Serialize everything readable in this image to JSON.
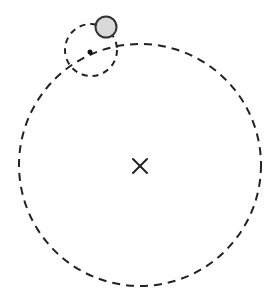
{
  "diagram": {
    "type": "epicycle-orbit",
    "deferent": {
      "cx": 140,
      "cy": 165,
      "r": 121,
      "stroke": "#222222",
      "dash": "8 6"
    },
    "epicycle": {
      "cx": 91,
      "cy": 50,
      "r": 26,
      "stroke": "#222222",
      "dash": "6 5"
    },
    "epicycle_center_dot": {
      "cx": 90,
      "cy": 52,
      "r": 2.5,
      "fill": "#111111"
    },
    "planet": {
      "cx": 106,
      "cy": 27,
      "r": 10.5,
      "fill": "#d9d9d9",
      "stroke": "#333333"
    },
    "center_mark": {
      "x": 140,
      "y": 166,
      "size": 7,
      "symbol": "×",
      "stroke": "#222222"
    }
  }
}
